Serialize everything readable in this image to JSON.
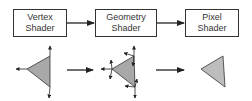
{
  "stages": [
    {
      "line1": "Vertex",
      "line2": "Shader"
    },
    {
      "line1": "Geometry",
      "line2": "Shader"
    },
    {
      "line1": "Pixel",
      "line2": "Shader"
    }
  ],
  "colors": {
    "stroke": "#333333",
    "triangle_fill": "#a8a8a8",
    "triangle_fill_light": "#bdbdbd"
  }
}
